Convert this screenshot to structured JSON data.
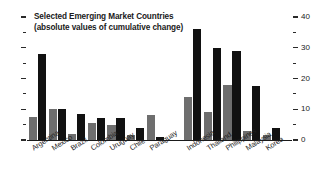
{
  "chart_data": {
    "type": "bar",
    "title": "Selected Emerging Market Countries",
    "subtitle": "(absolute values of cumulative change)",
    "xlabel": "",
    "ylabel": "",
    "ylim": [
      0,
      40
    ],
    "y_axis_position": "right",
    "grid": false,
    "legend": null,
    "y_ticks_major": [
      0,
      10,
      20,
      30,
      40
    ],
    "y_ticks_minor": [
      5,
      15,
      25,
      35
    ],
    "y_tick_labels": [
      "0",
      "10",
      "20",
      "30",
      "40"
    ],
    "categories": [
      "Argentina",
      "Mexico",
      "Brazil",
      "Colombia",
      "Uruguay",
      "Chile",
      "Paraguay",
      "Indonesia",
      "Thailand",
      "Philippines",
      "Malaysia",
      "Korea"
    ],
    "group_break_after": "Paraguay",
    "series": [
      {
        "name": "gray",
        "color": "#6e6e6e",
        "values": [
          7.5,
          10.0,
          1.8,
          5.5,
          5.0,
          1.5,
          8.0,
          14.0,
          9.0,
          18.0,
          3.0,
          1.5
        ]
      },
      {
        "name": "black",
        "color": "#111111",
        "values": [
          28.0,
          10.0,
          8.5,
          7.0,
          7.0,
          4.0,
          1.0,
          36.0,
          30.0,
          29.0,
          17.5,
          4.0
        ]
      }
    ]
  },
  "title": {
    "line1": "Selected Emerging Market Countries",
    "line2": "(absolute values of cumulative change)"
  }
}
